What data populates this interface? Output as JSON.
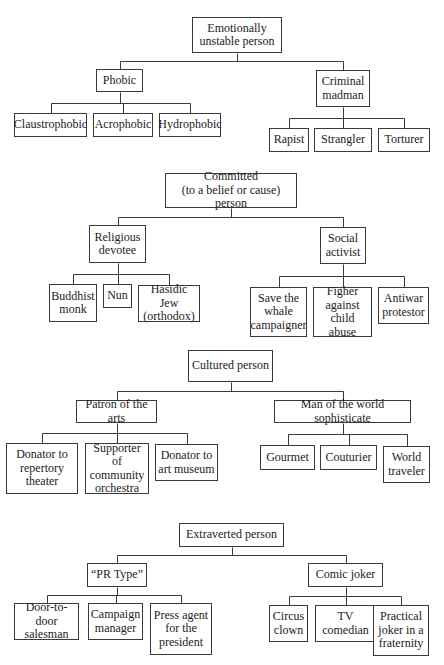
{
  "diagram": {
    "type": "hierarchy-trees",
    "line_color": "#3a3a3a",
    "trees": [
      {
        "name": "emotionally-unstable",
        "root": {
          "label": "Emotionally\nunstable person",
          "box": [
            192,
            17,
            90,
            36
          ]
        },
        "groups": [
          {
            "node": {
              "label": "Phobic",
              "box": [
                96,
                69,
                47,
                23
              ]
            },
            "children": [
              {
                "label": "Claustrophobic",
                "box": [
                  14,
                  113,
                  73,
                  24
                ]
              },
              {
                "label": "Acrophobic",
                "box": [
                  93,
                  113,
                  60,
                  24
                ]
              },
              {
                "label": "Hydrophobic",
                "box": [
                  159,
                  113,
                  62,
                  24
                ]
              }
            ]
          },
          {
            "node": {
              "label": "Criminal\nmadman",
              "box": [
                316,
                70,
                54,
                37
              ]
            },
            "children": [
              {
                "label": "Rapist",
                "box": [
                  269,
                  128,
                  40,
                  24
                ]
              },
              {
                "label": "Strangler",
                "box": [
                  314,
                  128,
                  58,
                  24
                ]
              },
              {
                "label": "Torturer",
                "box": [
                  378,
                  128,
                  52,
                  24
                ]
              }
            ]
          }
        ]
      },
      {
        "name": "committed",
        "root": {
          "label": "Committed\n(to a belief or cause) person",
          "box": [
            165,
            173,
            132,
            35
          ]
        },
        "groups": [
          {
            "node": {
              "label": "Religious\ndevotee",
              "box": [
                89,
                225,
                57,
                38
              ]
            },
            "children": [
              {
                "label": "Buddhist\nmonk",
                "box": [
                  49,
                  284,
                  48,
                  38
                ]
              },
              {
                "label": "Nun",
                "box": [
                  103,
                  284,
                  29,
                  24
                ]
              },
              {
                "label": "Hasidic Jew\n(orthodox)",
                "box": [
                  138,
                  285,
                  62,
                  37
                ]
              }
            ]
          },
          {
            "node": {
              "label": "Social\nactivist",
              "box": [
                320,
                227,
                46,
                37
              ]
            },
            "children": [
              {
                "label": "Save the\nwhale\ncampaigner",
                "box": [
                  250,
                  287,
                  57,
                  50
                ]
              },
              {
                "label": "Figher\nagainst\nchild abuse",
                "box": [
                  313,
                  287,
                  59,
                  50
                ]
              },
              {
                "label": "Antiwar\nprotestor",
                "box": [
                  378,
                  287,
                  51,
                  37
                ]
              }
            ]
          }
        ]
      },
      {
        "name": "cultured",
        "root": {
          "label": "Cultured person",
          "box": [
            188,
            350,
            85,
            32
          ]
        },
        "groups": [
          {
            "node": {
              "label": "Patron of the arts",
              "box": [
                76,
                400,
                81,
                23
              ]
            },
            "children": [
              {
                "label": "Donator to\nrepertory\ntheater",
                "box": [
                  6,
                  443,
                  72,
                  51
                ]
              },
              {
                "label": "Supporter of\ncommunity\norchestra",
                "box": [
                  85,
                  443,
                  64,
                  51
                ]
              },
              {
                "label": "Donator to\nart museum",
                "box": [
                  155,
                  444,
                  63,
                  37
                ]
              }
            ]
          },
          {
            "node": {
              "label": "Man of the world sophisticate",
              "box": [
                274,
                400,
                137,
                23
              ]
            },
            "children": [
              {
                "label": "Gourmet",
                "box": [
                  260,
                  445,
                  55,
                  25
                ]
              },
              {
                "label": "Couturier",
                "box": [
                  320,
                  445,
                  57,
                  25
                ]
              },
              {
                "label": "World\ntraveler",
                "box": [
                  383,
                  446,
                  47,
                  37
                ]
              }
            ]
          }
        ]
      },
      {
        "name": "extraverted",
        "root": {
          "label": "Extraverted person",
          "box": [
            179,
            523,
            105,
            24
          ]
        },
        "groups": [
          {
            "node": {
              "label": "“PR Type”",
              "box": [
                87,
                563,
                60,
                24
              ]
            },
            "children": [
              {
                "label": "Door-to-door\nsalesman",
                "box": [
                  14,
                  603,
                  65,
                  37
                ]
              },
              {
                "label": "Campaign\nmanager",
                "box": [
                  88,
                  603,
                  55,
                  37
                ]
              },
              {
                "label": "Press agent\nfor the\npresident",
                "box": [
                  150,
                  603,
                  62,
                  52
                ]
              }
            ]
          },
          {
            "node": {
              "label": "Comic joker",
              "box": [
                308,
                563,
                75,
                24
              ]
            },
            "children": [
              {
                "label": "Circus\nclown",
                "box": [
                  269,
                  605,
                  39,
                  37
                ]
              },
              {
                "label": "TV\ncomedian",
                "box": [
                  315,
                  605,
                  61,
                  37
                ]
              },
              {
                "label": "Practical\njoker in a\nfraternity",
                "box": [
                  373,
                  605,
                  56,
                  51
                ]
              }
            ]
          }
        ]
      }
    ]
  }
}
